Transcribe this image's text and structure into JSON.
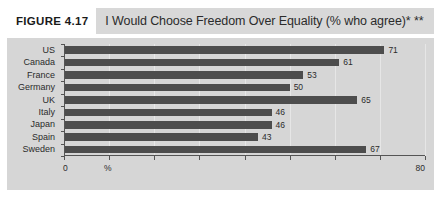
{
  "figure": {
    "tag": "FIGURE 4.17",
    "title": "I Would Choose Freedom Over Equality (% who agree)*  **",
    "footnote": ""
  },
  "axis": {
    "percent_symbol": "%",
    "min_label": "0",
    "max_label": "80"
  },
  "chart_data": {
    "type": "bar",
    "orientation": "horizontal",
    "title": "I Would Choose Freedom Over Equality (% who agree)*  **",
    "xlabel": "%",
    "ylabel": "",
    "xlim": [
      0,
      80
    ],
    "xticks": [
      0,
      10,
      20,
      30,
      40,
      50,
      60,
      70,
      80
    ],
    "xtick_labels": [
      "0",
      "",
      "",
      "",
      "",
      "",
      "",
      "",
      "80"
    ],
    "grid": true,
    "legend": false,
    "bar_color": "#4d4d4d",
    "categories": [
      "US",
      "Canada",
      "France",
      "Germany",
      "UK",
      "Italy",
      "Japan",
      "Spain",
      "Sweden"
    ],
    "values": [
      71,
      61,
      53,
      50,
      65,
      46,
      46,
      43,
      67
    ],
    "data_labels": [
      "71",
      "61",
      "53",
      "50",
      "65",
      "46",
      "46",
      "43",
      "67"
    ]
  }
}
